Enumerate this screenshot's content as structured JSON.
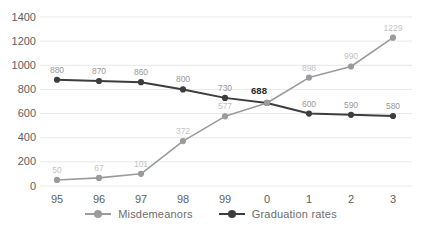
{
  "chart_data": {
    "type": "line",
    "title": "",
    "xlabel": "",
    "ylabel": "",
    "categories": [
      "95",
      "96",
      "97",
      "98",
      "99",
      "0",
      "1",
      "2",
      "3"
    ],
    "series": [
      {
        "name": "Misdemeanors",
        "values": [
          50,
          67,
          101,
          372,
          577,
          688,
          898,
          990,
          1229
        ],
        "labels": [
          "50",
          "67",
          "101",
          "372",
          "577",
          "",
          "898",
          "990",
          "1229"
        ],
        "color": "#9b9b9b",
        "label_color": "#c3c3c3"
      },
      {
        "name": "Graduation rates",
        "values": [
          880,
          870,
          860,
          800,
          730,
          688,
          600,
          590,
          580
        ],
        "labels": [
          "880",
          "870",
          "860",
          "800",
          "730",
          "",
          "600",
          "590",
          "580"
        ],
        "color": "#3d3d3d",
        "label_color": "#999999"
      }
    ],
    "shared_point": {
      "category_index": 5,
      "label": "688",
      "label_color": "#2b2b2b",
      "bold": true
    },
    "ylim": [
      0,
      1400
    ],
    "yticks": [
      0,
      200,
      400,
      600,
      800,
      1000,
      1200,
      1400
    ],
    "grid": true,
    "gridline_color": "#e9e9e9",
    "axis_label_color": "#5e5e5e",
    "legend_position": "bottom"
  },
  "legend": {
    "items": [
      {
        "label": "Misdemeanors",
        "color": "#9b9b9b"
      },
      {
        "label": "Graduation rates",
        "color": "#3d3d3d"
      }
    ]
  }
}
